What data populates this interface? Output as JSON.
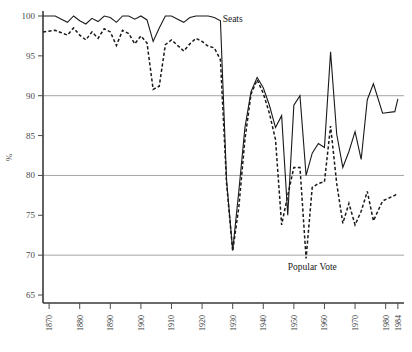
{
  "chart_data": {
    "type": "line",
    "title": "",
    "xlabel": "",
    "ylabel": "%",
    "xlim": [
      1868,
      1986
    ],
    "ylim": [
      64,
      100.5
    ],
    "yticks": [
      100,
      95,
      90,
      85,
      80,
      75,
      70,
      65
    ],
    "ytick_labels": [
      "100",
      "95",
      "90",
      "85",
      "80",
      "75",
      "70",
      "65"
    ],
    "xticks": [
      1870,
      1880,
      1890,
      1900,
      1910,
      1920,
      1930,
      1940,
      1950,
      1960,
      1970,
      1980,
      1984
    ],
    "xtick_labels": [
      "1870",
      "1880",
      "1890",
      "1900",
      "1910",
      "1920",
      "1930",
      "1940",
      "1950",
      "1960",
      "1970",
      "1980",
      "1984"
    ],
    "gridlines": [
      90,
      80,
      70
    ],
    "grid": true,
    "legend_position": "inline-annotation",
    "annotations": [
      {
        "text": "Seats",
        "x": 1930,
        "y": 99.2
      },
      {
        "text": "Popular Vote",
        "x": 1948,
        "y": 68.2
      }
    ],
    "series": [
      {
        "name": "Seats",
        "style": "solid",
        "color": "#1a1a1a",
        "x": [
          1868,
          1872,
          1874,
          1876,
          1878,
          1880,
          1882,
          1884,
          1886,
          1888,
          1890,
          1892,
          1894,
          1896,
          1898,
          1900,
          1902,
          1904,
          1906,
          1908,
          1910,
          1912,
          1914,
          1916,
          1918,
          1920,
          1922,
          1924,
          1926,
          1928,
          1930,
          1932,
          1934,
          1936,
          1938,
          1940,
          1942,
          1944,
          1946,
          1948,
          1950,
          1952,
          1954,
          1956,
          1958,
          1960,
          1962,
          1964,
          1966,
          1968,
          1970,
          1972,
          1974,
          1976,
          1979,
          1983,
          1984
        ],
        "values": [
          100,
          100,
          99.6,
          99.2,
          100,
          99.4,
          99.0,
          99.7,
          99.3,
          100,
          99.8,
          99.2,
          100,
          100,
          99.6,
          100,
          99.5,
          96.8,
          98.5,
          100,
          100,
          99.6,
          99.2,
          99.8,
          100,
          100,
          100,
          99.8,
          99.4,
          79.4,
          70.6,
          78.0,
          86.0,
          90.5,
          92.3,
          91.0,
          88.8,
          86.0,
          87.5,
          75.0,
          88.8,
          90.0,
          80.0,
          82.8,
          84.0,
          83.5,
          95.5,
          85.2,
          81.0,
          83.0,
          85.5,
          82.0,
          89.5,
          91.5,
          87.8,
          88.0,
          89.6
        ]
      },
      {
        "name": "Popular Vote",
        "style": "dashed",
        "color": "#1a1a1a",
        "x": [
          1868,
          1872,
          1874,
          1876,
          1878,
          1880,
          1882,
          1884,
          1886,
          1888,
          1890,
          1892,
          1894,
          1896,
          1898,
          1900,
          1902,
          1904,
          1906,
          1908,
          1910,
          1912,
          1914,
          1916,
          1918,
          1920,
          1922,
          1924,
          1926,
          1928,
          1930,
          1932,
          1934,
          1936,
          1938,
          1940,
          1942,
          1944,
          1946,
          1948,
          1950,
          1952,
          1954,
          1956,
          1958,
          1960,
          1962,
          1964,
          1966,
          1968,
          1970,
          1972,
          1974,
          1976,
          1979,
          1983,
          1984
        ],
        "values": [
          98.0,
          98.2,
          97.9,
          97.6,
          98.5,
          97.6,
          97.0,
          98.0,
          97.2,
          98.4,
          98.0,
          96.3,
          98.2,
          97.8,
          96.5,
          97.5,
          96.6,
          90.8,
          91.2,
          96.4,
          97.0,
          96.3,
          95.6,
          96.5,
          97.2,
          96.8,
          96.2,
          96.0,
          94.5,
          79.0,
          70.5,
          76.0,
          84.5,
          90.2,
          92.0,
          90.3,
          87.8,
          84.5,
          73.8,
          77.5,
          81.0,
          81.0,
          69.6,
          78.5,
          79.0,
          79.2,
          86.2,
          79.0,
          74.0,
          76.5,
          73.8,
          75.5,
          78.0,
          74.3,
          76.8,
          77.5,
          77.8
        ]
      }
    ]
  },
  "axis": {
    "y_axis_title": "%"
  }
}
